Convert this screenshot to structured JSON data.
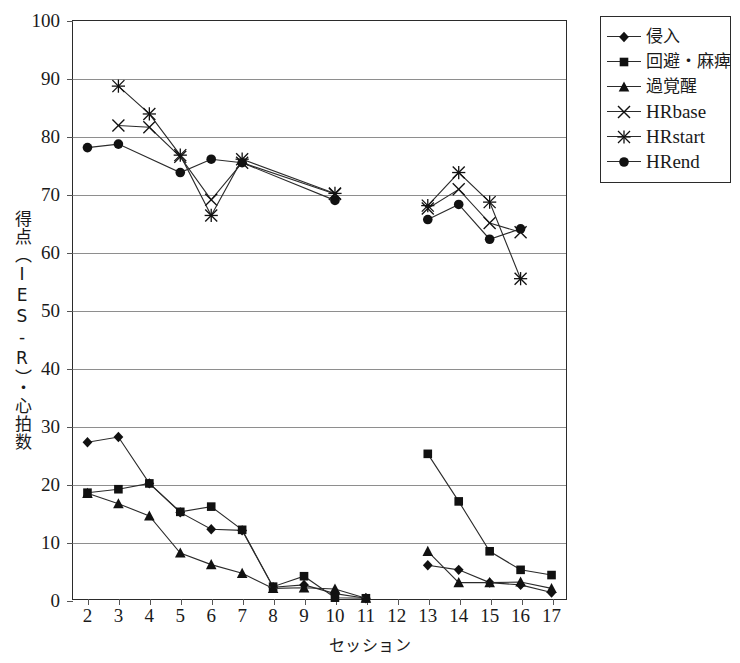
{
  "chart_data": {
    "type": "line",
    "title": "",
    "xlabel": "セッション",
    "ylabel": "得点（IES-R）・心拍数",
    "xlim": [
      1.5,
      17.5
    ],
    "ylim": [
      0,
      100
    ],
    "ytick_step": 10,
    "grid": true,
    "legend_position": "top-right-outside",
    "x_ticks": [
      2,
      3,
      4,
      5,
      6,
      7,
      8,
      9,
      10,
      11,
      12,
      13,
      14,
      15,
      16,
      17
    ],
    "y_ticks": [
      0,
      10,
      20,
      30,
      40,
      50,
      60,
      70,
      80,
      90,
      100
    ],
    "series": [
      {
        "name": "侵入",
        "marker": "diamond",
        "points": [
          {
            "x": 2,
            "y": 27.2
          },
          {
            "x": 3,
            "y": 28.1
          },
          {
            "x": 4,
            "y": 20.1
          },
          {
            "x": 5,
            "y": 15.1
          },
          {
            "x": 6,
            "y": 12.2
          },
          {
            "x": 7,
            "y": 12.0
          },
          {
            "x": 8,
            "y": 2.2
          },
          {
            "x": 9,
            "y": 2.6
          },
          {
            "x": 10,
            "y": 1.1
          },
          {
            "x": 11,
            "y": 0.3
          }
        ],
        "points_2": [
          {
            "x": 13,
            "y": 6.0
          },
          {
            "x": 14,
            "y": 5.2
          },
          {
            "x": 15,
            "y": 3.0
          },
          {
            "x": 16,
            "y": 2.6
          },
          {
            "x": 17,
            "y": 1.3
          }
        ]
      },
      {
        "name": "回避・麻痺",
        "marker": "square",
        "points": [
          {
            "x": 2,
            "y": 18.5
          },
          {
            "x": 3,
            "y": 19.1
          },
          {
            "x": 4,
            "y": 20.1
          },
          {
            "x": 5,
            "y": 15.2
          },
          {
            "x": 6,
            "y": 16.1
          },
          {
            "x": 7,
            "y": 12.1
          },
          {
            "x": 8,
            "y": 2.3
          },
          {
            "x": 9,
            "y": 4.1
          },
          {
            "x": 10,
            "y": 0.4
          },
          {
            "x": 11,
            "y": 0.3
          }
        ],
        "points_2": [
          {
            "x": 13,
            "y": 25.2
          },
          {
            "x": 14,
            "y": 17.0
          },
          {
            "x": 15,
            "y": 8.4
          },
          {
            "x": 16,
            "y": 5.2
          },
          {
            "x": 17,
            "y": 4.3
          }
        ]
      },
      {
        "name": "過覚醒",
        "marker": "triangle",
        "points": [
          {
            "x": 2,
            "y": 18.4
          },
          {
            "x": 3,
            "y": 16.6
          },
          {
            "x": 4,
            "y": 14.5
          },
          {
            "x": 5,
            "y": 8.1
          },
          {
            "x": 6,
            "y": 6.1
          },
          {
            "x": 7,
            "y": 4.6
          },
          {
            "x": 8,
            "y": 2.0
          },
          {
            "x": 9,
            "y": 2.1
          },
          {
            "x": 10,
            "y": 1.9
          },
          {
            "x": 11,
            "y": 0.3
          }
        ],
        "points_2": [
          {
            "x": 13,
            "y": 8.4
          },
          {
            "x": 14,
            "y": 3.0
          },
          {
            "x": 15,
            "y": 3.0
          },
          {
            "x": 16,
            "y": 3.1
          },
          {
            "x": 17,
            "y": 2.0
          }
        ]
      },
      {
        "name": "HRbase",
        "marker": "x",
        "points": [
          {
            "x": 3,
            "y": 81.8
          },
          {
            "x": 4,
            "y": 81.5
          },
          {
            "x": 5,
            "y": 76.4
          },
          {
            "x": 6,
            "y": 69.0
          },
          {
            "x": 7,
            "y": 75.4
          },
          {
            "x": 10,
            "y": 70.0
          }
        ],
        "points_2": [
          {
            "x": 13,
            "y": 67.5
          },
          {
            "x": 14,
            "y": 70.8
          },
          {
            "x": 15,
            "y": 65.0
          },
          {
            "x": 16,
            "y": 63.4
          }
        ]
      },
      {
        "name": "HRstart",
        "marker": "asterisk",
        "points": [
          {
            "x": 3,
            "y": 88.6
          },
          {
            "x": 4,
            "y": 83.8
          },
          {
            "x": 5,
            "y": 76.7
          },
          {
            "x": 6,
            "y": 66.3
          },
          {
            "x": 7,
            "y": 76.0
          },
          {
            "x": 10,
            "y": 70.1
          }
        ],
        "points_2": [
          {
            "x": 13,
            "y": 68.0
          },
          {
            "x": 14,
            "y": 73.7
          },
          {
            "x": 15,
            "y": 68.6
          },
          {
            "x": 16,
            "y": 55.4
          }
        ]
      },
      {
        "name": "HRend",
        "marker": "circle",
        "points": [
          {
            "x": 2,
            "y": 78.0
          },
          {
            "x": 3,
            "y": 78.6
          },
          {
            "x": 5,
            "y": 73.7
          },
          {
            "x": 6,
            "y": 76.0
          },
          {
            "x": 7,
            "y": 75.4
          },
          {
            "x": 10,
            "y": 68.9
          }
        ],
        "points_2": [
          {
            "x": 13,
            "y": 65.6
          },
          {
            "x": 14,
            "y": 68.2
          },
          {
            "x": 15,
            "y": 62.2
          },
          {
            "x": 16,
            "y": 64.0
          }
        ]
      }
    ],
    "colors": {
      "line": "#2b2b2b",
      "marker": "#111111",
      "grid": "#8e8e8e",
      "frame": "#2b2b2b",
      "background": "#ffffff"
    }
  }
}
